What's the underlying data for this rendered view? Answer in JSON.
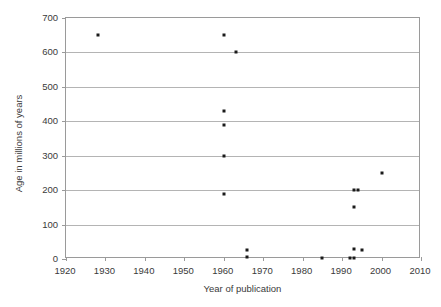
{
  "chart_data": {
    "type": "scatter",
    "title": "",
    "xlabel": "Year of publication",
    "ylabel": "Age in millions of years",
    "xlim": [
      1920,
      2010
    ],
    "ylim": [
      0,
      700
    ],
    "xticks": [
      1920,
      1930,
      1940,
      1950,
      1960,
      1970,
      1980,
      1990,
      2000,
      2010
    ],
    "yticks": [
      0,
      100,
      200,
      300,
      400,
      500,
      600,
      700
    ],
    "grid": "horizontal",
    "legend": "none",
    "marker_color": "#1a1a1a",
    "gridline_color": "#b4b4b4",
    "axis_color": "#9a9a9a",
    "points": [
      {
        "x": 1928,
        "y": 650
      },
      {
        "x": 1960,
        "y": 650
      },
      {
        "x": 1963,
        "y": 600
      },
      {
        "x": 1960,
        "y": 430
      },
      {
        "x": 1960,
        "y": 390
      },
      {
        "x": 1960,
        "y": 300
      },
      {
        "x": 1960,
        "y": 190
      },
      {
        "x": 1966,
        "y": 25
      },
      {
        "x": 1966,
        "y": 5
      },
      {
        "x": 1985,
        "y": 2
      },
      {
        "x": 1992,
        "y": 2
      },
      {
        "x": 1993,
        "y": 3
      },
      {
        "x": 1993,
        "y": 30
      },
      {
        "x": 1995,
        "y": 25
      },
      {
        "x": 1993,
        "y": 200
      },
      {
        "x": 1994,
        "y": 200
      },
      {
        "x": 1993,
        "y": 150
      },
      {
        "x": 2000,
        "y": 250
      }
    ]
  }
}
